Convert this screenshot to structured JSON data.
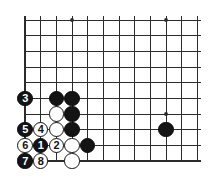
{
  "board": {
    "title": "Go board diagram",
    "type": "go-joseki-diagram",
    "line_color": "#2b2b2b",
    "black_color": "#141414",
    "white_color": "#ffffff",
    "background_color": "#ffffff",
    "geometry": {
      "origin_x": 25,
      "origin_y": 20,
      "cell": 15.67,
      "cols": 12,
      "rows": 10,
      "stone_radius": 7.6,
      "edges": {
        "left": true,
        "bottom": true,
        "top": false,
        "right": false
      }
    },
    "star_points": [
      {
        "col": 3,
        "row": 0
      },
      {
        "col": 9,
        "row": 0
      },
      {
        "col": 9,
        "row": 6
      }
    ],
    "stones": [
      {
        "id": "b-d7",
        "color": "black",
        "col": 2,
        "row": 5,
        "label": ""
      },
      {
        "id": "b-e7",
        "color": "black",
        "col": 3,
        "row": 5,
        "label": ""
      },
      {
        "id": "m3",
        "color": "black",
        "col": 0,
        "row": 5,
        "label": "3"
      },
      {
        "id": "w-d6",
        "color": "white",
        "col": 2,
        "row": 6,
        "label": ""
      },
      {
        "id": "b-e6",
        "color": "black",
        "col": 3,
        "row": 6,
        "label": ""
      },
      {
        "id": "m5",
        "color": "black",
        "col": 0,
        "row": 7,
        "label": "5"
      },
      {
        "id": "m4",
        "color": "white",
        "col": 1,
        "row": 7,
        "label": "4"
      },
      {
        "id": "w-d5",
        "color": "white",
        "col": 2,
        "row": 7,
        "label": ""
      },
      {
        "id": "b-e5",
        "color": "black",
        "col": 3,
        "row": 7,
        "label": ""
      },
      {
        "id": "m6",
        "color": "white",
        "col": 0,
        "row": 8,
        "label": "6"
      },
      {
        "id": "m1",
        "color": "black",
        "col": 1,
        "row": 8,
        "label": "1"
      },
      {
        "id": "m2",
        "color": "white",
        "col": 2,
        "row": 8,
        "label": "2"
      },
      {
        "id": "w-d4",
        "color": "white",
        "col": 3,
        "row": 8,
        "label": ""
      },
      {
        "id": "b-f4",
        "color": "black",
        "col": 4,
        "row": 8,
        "label": ""
      },
      {
        "id": "m7",
        "color": "black",
        "col": 0,
        "row": 9,
        "label": "7"
      },
      {
        "id": "m8",
        "color": "white",
        "col": 1,
        "row": 9,
        "label": "8"
      },
      {
        "id": "w-e3",
        "color": "white",
        "col": 3,
        "row": 9,
        "label": ""
      },
      {
        "id": "b-far",
        "color": "black",
        "col": 9,
        "row": 7,
        "label": ""
      }
    ],
    "move_sequence": [
      "1",
      "2",
      "3",
      "4",
      "5",
      "6",
      "7",
      "8"
    ]
  }
}
